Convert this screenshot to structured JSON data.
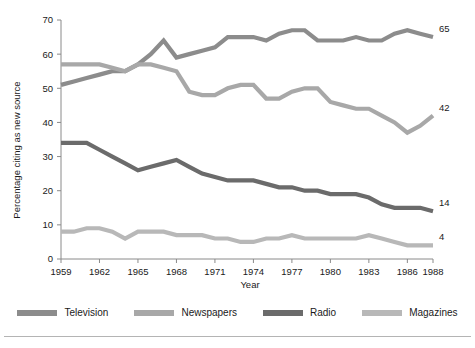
{
  "chart_data": {
    "type": "line",
    "title": "",
    "xlabel": "Year",
    "ylabel": "Percentage citing as new source",
    "xlim": [
      1959,
      1988
    ],
    "ylim": [
      0,
      70
    ],
    "ytick_labels": [
      "0",
      "10",
      "20",
      "30",
      "40",
      "50",
      "60",
      "70"
    ],
    "ytick_values": [
      0,
      10,
      20,
      30,
      40,
      50,
      60,
      70
    ],
    "xtick_labels": [
      "1959",
      "1962",
      "1965",
      "1968",
      "1971",
      "1974",
      "1977",
      "1980",
      "1983",
      "1986",
      "1988"
    ],
    "xtick_values": [
      1959,
      1962,
      1965,
      1968,
      1971,
      1974,
      1977,
      1980,
      1983,
      1986,
      1988
    ],
    "grid": false,
    "legend_position": "bottom",
    "x": [
      1959,
      1960,
      1961,
      1962,
      1963,
      1964,
      1965,
      1966,
      1967,
      1968,
      1969,
      1970,
      1971,
      1972,
      1973,
      1974,
      1975,
      1976,
      1977,
      1978,
      1979,
      1980,
      1981,
      1982,
      1983,
      1984,
      1985,
      1986,
      1987,
      1988
    ],
    "series": [
      {
        "name": "Television",
        "color": "#8c8c8c",
        "end_label": "65",
        "values": [
          51,
          52,
          53,
          54,
          55,
          55,
          57,
          60,
          64,
          59,
          60,
          61,
          62,
          65,
          65,
          65,
          64,
          66,
          67,
          67,
          64,
          64,
          64,
          65,
          64,
          64,
          66,
          67,
          66,
          65
        ]
      },
      {
        "name": "Newspapers",
        "color": "#a8a8a8",
        "end_label": "42",
        "values": [
          57,
          57,
          57,
          57,
          56,
          55,
          57,
          57,
          56,
          55,
          49,
          48,
          48,
          50,
          51,
          51,
          47,
          47,
          49,
          50,
          50,
          46,
          45,
          44,
          44,
          42,
          40,
          37,
          39,
          42
        ]
      },
      {
        "name": "Radio",
        "color": "#6b6b6b",
        "end_label": "14",
        "values": [
          34,
          34,
          34,
          32,
          30,
          28,
          26,
          27,
          28,
          29,
          27,
          25,
          24,
          23,
          23,
          23,
          22,
          21,
          21,
          20,
          20,
          19,
          19,
          19,
          18,
          16,
          15,
          15,
          15,
          14
        ]
      },
      {
        "name": "Magazines",
        "color": "#b8b8b8",
        "end_label": "4",
        "values": [
          8,
          8,
          9,
          9,
          8,
          6,
          8,
          8,
          8,
          7,
          7,
          7,
          6,
          6,
          5,
          5,
          6,
          6,
          7,
          6,
          6,
          6,
          6,
          6,
          7,
          6,
          5,
          4,
          4,
          4
        ]
      }
    ]
  },
  "legend": {
    "items": [
      {
        "label": "Television",
        "color": "#8c8c8c"
      },
      {
        "label": "Newspapers",
        "color": "#a8a8a8"
      },
      {
        "label": "Radio",
        "color": "#6b6b6b"
      },
      {
        "label": "Magazines",
        "color": "#b8b8b8"
      }
    ]
  },
  "axis": {
    "x_title": "Year",
    "y_title": "Percentage citing as new source"
  }
}
